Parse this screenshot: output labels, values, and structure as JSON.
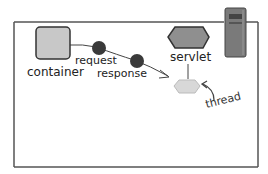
{
  "diagram": {
    "labels": {
      "container": "container",
      "request": "request",
      "response": "response",
      "servlet": "servlet",
      "thread": "thread"
    },
    "icons": {
      "container": "gray-square",
      "request": "dark-dot",
      "response": "dark-dot",
      "servlet": "gray-hexagon",
      "thread": "light-hexagon",
      "server": "server-tower"
    },
    "colors": {
      "border": "#555555",
      "container_fill": "#c8c8c8",
      "dot_fill": "#3a3a3a",
      "servlet_fill": "#8f8f8f",
      "thread_fill": "#d8d8d8",
      "server_fill": "#7a7a7a",
      "line": "#444444"
    }
  }
}
